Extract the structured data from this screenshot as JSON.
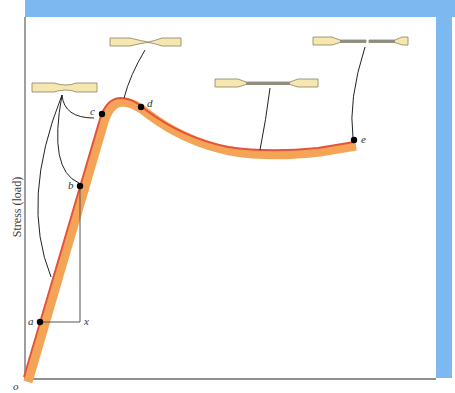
{
  "diagram": {
    "type": "stress-strain curve (tensile test)",
    "y_axis_label": "Stress (load)",
    "origin_label": "o",
    "colors": {
      "frame_blue": "#7DB8F0",
      "curve_band": "#F4A456",
      "curve_edge": "#E5533B",
      "specimen_fill": "#F6E6B0",
      "specimen_stroke": "#8a8060",
      "axis": "#6b6b6b",
      "leader": "#222222"
    },
    "points": [
      {
        "label": "a",
        "x": 40,
        "y": 322
      },
      {
        "label": "b",
        "x": 80,
        "y": 186
      },
      {
        "label": "c",
        "x": 102,
        "y": 114
      },
      {
        "label": "d",
        "x": 141,
        "y": 107
      },
      {
        "label": "e",
        "x": 354,
        "y": 140
      }
    ],
    "bracket_label": "x",
    "specimens": [
      {
        "name": "elastic-specimen",
        "state": "slight necking"
      },
      {
        "name": "necking-specimen",
        "state": "neck forming"
      },
      {
        "name": "drawn-specimen",
        "state": "uniformly drawn"
      },
      {
        "name": "fractured-specimen",
        "state": "fractured"
      }
    ]
  }
}
